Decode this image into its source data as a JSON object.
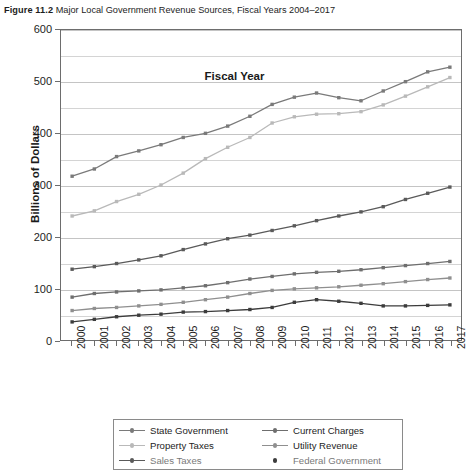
{
  "figure": {
    "label": "Figure 11.2",
    "title": "Major Local Government Revenue Sources, Fiscal Years 2004–2017"
  },
  "chart_data": {
    "type": "line",
    "title": "Major Local Government Revenue Sources, Fiscal Years 2004–2017",
    "xlabel": "Fiscal Year",
    "ylabel": "Billions of Dollars",
    "ylim": [
      0,
      600
    ],
    "ytick_step": 100,
    "yticks": [
      0,
      100,
      200,
      300,
      400,
      500,
      600
    ],
    "minor_gridline_step": 50,
    "grid": true,
    "legend_position": "bottom",
    "x": [
      2000,
      2001,
      2002,
      2003,
      2004,
      2005,
      2006,
      2007,
      2008,
      2009,
      2010,
      2011,
      2012,
      2013,
      2014,
      2015,
      2016,
      2017
    ],
    "categories": [
      "2000",
      "2001",
      "2002",
      "2003",
      "2004",
      "2005",
      "2006",
      "2007",
      "2008",
      "2009",
      "2010",
      "2011",
      "2012",
      "2013",
      "2014",
      "2015",
      "2016",
      "2017"
    ],
    "series": [
      {
        "name": "State Government",
        "color": "#7a7a7a",
        "values": [
          317,
          331,
          355,
          366,
          378,
          392,
          400,
          414,
          433,
          456,
          470,
          478,
          469,
          463,
          482,
          500,
          519,
          528
        ]
      },
      {
        "name": "Property Taxes",
        "color": "#b9b9b9",
        "values": [
          240,
          250,
          268,
          282,
          300,
          323,
          351,
          373,
          392,
          420,
          432,
          437,
          438,
          442,
          455,
          472,
          490,
          508
        ]
      },
      {
        "name": "Sales Taxes",
        "color": "#5a5a5a",
        "values": [
          137,
          142,
          148,
          155,
          163,
          175,
          186,
          196,
          203,
          212,
          221,
          231,
          240,
          248,
          258,
          272,
          284,
          296
        ]
      },
      {
        "name": "Current Charges",
        "color": "#6e6e6e",
        "values": [
          83,
          90,
          93,
          95,
          97,
          101,
          105,
          111,
          118,
          123,
          128,
          131,
          133,
          136,
          140,
          144,
          148,
          152
        ]
      },
      {
        "name": "Utility Revenue",
        "color": "#8f8f8f",
        "values": [
          57,
          61,
          63,
          66,
          69,
          73,
          78,
          83,
          90,
          96,
          99,
          101,
          103,
          106,
          109,
          113,
          117,
          120
        ]
      },
      {
        "name": "Federal Government",
        "color": "#3c3c3c",
        "values": [
          35,
          40,
          45,
          48,
          50,
          54,
          55,
          57,
          59,
          63,
          73,
          78,
          75,
          71,
          66,
          66,
          67,
          68
        ]
      }
    ]
  },
  "legend": {
    "left_column": [
      {
        "label": "State Government",
        "color": "#7a7a7a",
        "marker": "line-dot"
      },
      {
        "label": "Property Taxes",
        "color": "#b9b9b9",
        "marker": "line-dot"
      },
      {
        "label": "Sales Taxes",
        "color": "#5a5a5a",
        "marker": "line-dot"
      }
    ],
    "right_column": [
      {
        "label": "Current Charges",
        "color": "#6e6e6e",
        "marker": "line-dot"
      },
      {
        "label": "Utility Revenue",
        "color": "#8f8f8f",
        "marker": "line-dot"
      },
      {
        "label": "Federal Government",
        "color": "#3c3c3c",
        "marker": "dot"
      }
    ]
  }
}
